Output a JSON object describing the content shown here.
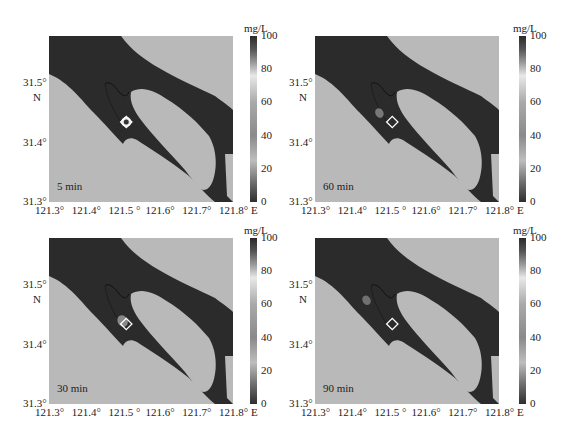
{
  "chart_data": [
    {
      "type": "heatmap",
      "title": "",
      "time_label": "5 min",
      "xlabel": "E",
      "ylabel": "N",
      "xticks": [
        "121.3°",
        "121.4°",
        "121.5 °",
        "121.6°",
        "121.7°",
        "121.8° E"
      ],
      "yticks": [
        "31.5°",
        "31.4°",
        "31.3°"
      ],
      "xlim": [
        121.3,
        121.8
      ],
      "ylim": [
        31.3,
        31.58
      ],
      "colorbar": {
        "label": "mg/L",
        "ticks": [
          0,
          20,
          40,
          60,
          80,
          100
        ],
        "range": [
          0,
          100
        ]
      },
      "marker": {
        "shape": "diamond",
        "lon": 121.51,
        "lat": 31.435
      },
      "plume": {
        "lon": 121.51,
        "lat": 31.437,
        "peak_mg_per_L": 100,
        "note": "concentrated ring at discharge point"
      }
    },
    {
      "type": "heatmap",
      "time_label": "60 min",
      "xlabel": "E",
      "ylabel": "N",
      "xticks": [
        "121.3°",
        "121.4°",
        "121.5 °",
        "121.6°",
        "121.7°",
        "121.8° E"
      ],
      "yticks": [
        "31.5°",
        "31.4°",
        "31.3°"
      ],
      "xlim": [
        121.3,
        121.8
      ],
      "ylim": [
        31.3,
        31.58
      ],
      "colorbar": {
        "label": "mg/L",
        "ticks": [
          0,
          20,
          40,
          60,
          80,
          100
        ],
        "range": [
          0,
          100
        ]
      },
      "marker": {
        "shape": "diamond",
        "lon": 121.51,
        "lat": 31.435
      },
      "plume": {
        "lon": 121.475,
        "lat": 31.45,
        "peak_mg_per_L": 50,
        "note": "diffuse plume drifted NW"
      }
    },
    {
      "type": "heatmap",
      "time_label": "30 min",
      "xlabel": "E",
      "ylabel": "N",
      "xticks": [
        "121.3°",
        "121.4°",
        "121.5 °",
        "121.6°",
        "121.7°",
        "121.8° E"
      ],
      "yticks": [
        "31.5°",
        "31.4°",
        "31.3°"
      ],
      "xlim": [
        121.3,
        121.8
      ],
      "ylim": [
        31.3,
        31.58
      ],
      "colorbar": {
        "label": "mg/L",
        "ticks": [
          0,
          20,
          40,
          60,
          80,
          100
        ],
        "range": [
          0,
          100
        ]
      },
      "marker": {
        "shape": "diamond",
        "lon": 121.51,
        "lat": 31.435
      },
      "plume": {
        "lon": 121.5,
        "lat": 31.44,
        "peak_mg_per_L": 70,
        "note": "plume spreading just NW of source"
      }
    },
    {
      "type": "heatmap",
      "time_label": "90 min",
      "xlabel": "E",
      "ylabel": "N",
      "xticks": [
        "121.3°",
        "121.4°",
        "121.5 °",
        "121.6°",
        "121.7°",
        "121.8° E"
      ],
      "yticks": [
        "31.5°",
        "31.4°",
        "31.3°"
      ],
      "xlim": [
        121.3,
        121.8
      ],
      "ylim": [
        31.3,
        31.58
      ],
      "colorbar": {
        "label": "mg/L",
        "ticks": [
          0,
          20,
          40,
          60,
          80,
          100
        ],
        "range": [
          0,
          100
        ]
      },
      "marker": {
        "shape": "diamond",
        "lon": 121.51,
        "lat": 31.435
      },
      "plume": {
        "lon": 121.44,
        "lat": 31.475,
        "peak_mg_per_L": 40,
        "note": "faint plume further NW"
      }
    }
  ],
  "panels": [
    {
      "time": "5 min",
      "unit": "mg/L",
      "north": "N"
    },
    {
      "time": "60 min",
      "unit": "mg/L",
      "north": "N"
    },
    {
      "time": "30 min",
      "unit": "mg/L",
      "north": "N"
    },
    {
      "time": "90 min",
      "unit": "mg/L",
      "north": "N"
    }
  ],
  "axes": {
    "xticks": [
      "121.3°",
      "121.4°",
      "121.5 °",
      "121.6°",
      "121.7°",
      "121.8° E"
    ],
    "yticks": [
      "31.5°",
      "31.4°",
      "31.3°"
    ],
    "cbticks": [
      "100",
      "80",
      "60",
      "40",
      "20",
      "0"
    ]
  },
  "colors": {
    "land": "#b9b9b9",
    "water": "#2b2b2b",
    "marker": "#ffffff"
  }
}
